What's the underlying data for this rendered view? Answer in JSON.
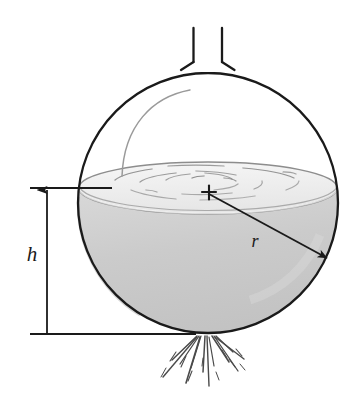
{
  "figure": {
    "type": "technical-diagram",
    "background_color": "#ffffff",
    "labels": {
      "height": "h",
      "radius": "r"
    },
    "annotations": {
      "center_marker": "+",
      "center_marker_name": "sphere-center-cross"
    },
    "colors": {
      "outline": "#1a1a1a",
      "water_fill": "#c9c9c9",
      "water_fill_light": "#d6d6d6",
      "surface_fill": "#f2f2f2",
      "ripple": "#8a8a8a",
      "highlight_arc": "#9a9a9a",
      "dimension_line": "#1a1a1a",
      "spray": "#4a4a4a"
    },
    "geometry": {
      "sphere_center_x": 208,
      "sphere_center_y": 203,
      "sphere_radius": 130,
      "water_surface_y": 188,
      "water_surface_rx": 129,
      "water_surface_ry": 26,
      "neck_left_x": 193,
      "neck_right_x": 222,
      "neck_top_y": 28,
      "neck_bottom_y": 64,
      "dimension_x": 47,
      "dimension_top_y": 188,
      "dimension_bottom_y": 334,
      "radius_arrow_start_x": 209,
      "radius_arrow_start_y": 194,
      "radius_arrow_end_x": 329,
      "radius_arrow_end_y": 259,
      "label_h_x": 32,
      "label_h_y": 260,
      "label_r_x": 252,
      "label_r_y": 246
    },
    "elements": {
      "sphere_name": "spherical-tank-outline",
      "water_name": "water-body",
      "water_surface_name": "water-surface-ellipse",
      "neck_name": "tank-neck-pipe",
      "highlight_name": "glass-highlight-arc",
      "ripples_name": "water-surface-ripples",
      "spray_name": "water-jet-spray",
      "dimension_name": "height-dimension-line",
      "radius_name": "radius-arrow"
    }
  }
}
